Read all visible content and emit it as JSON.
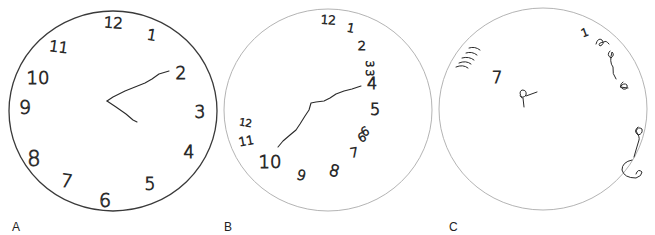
{
  "figure": {
    "panels": [
      {
        "label": "A",
        "label_pos": [
          12,
          221
        ],
        "face": {
          "cx": 113,
          "cy": 111,
          "rx": 104,
          "ry": 100,
          "stroke": "#3a3a3a",
          "width": 1.3
        },
        "numerals": [
          {
            "text": "12",
            "x": 113,
            "y": 28,
            "size": 15,
            "rot": 4
          },
          {
            "text": "1",
            "x": 151,
            "y": 40,
            "size": 15,
            "rot": 10
          },
          {
            "text": "2",
            "x": 181,
            "y": 79,
            "size": 17,
            "rot": 0
          },
          {
            "text": "3",
            "x": 200,
            "y": 118,
            "size": 17,
            "rot": 0
          },
          {
            "text": "4",
            "x": 189,
            "y": 158,
            "size": 17,
            "rot": 0
          },
          {
            "text": "5",
            "x": 150,
            "y": 190,
            "size": 17,
            "rot": 0
          },
          {
            "text": "6",
            "x": 105,
            "y": 207,
            "size": 19,
            "rot": 0
          },
          {
            "text": "7",
            "x": 66,
            "y": 187,
            "size": 18,
            "rot": 8
          },
          {
            "text": "8",
            "x": 34,
            "y": 166,
            "size": 21,
            "rot": 0
          },
          {
            "text": "9",
            "x": 25,
            "y": 114,
            "size": 19,
            "rot": 0
          },
          {
            "text": "10",
            "x": 38,
            "y": 84,
            "size": 18,
            "rot": 0
          },
          {
            "text": "11",
            "x": 58,
            "y": 52,
            "size": 15,
            "rot": 8
          }
        ],
        "hands": [
          "M107,101 L113,97 L125,91 L135,87 L145,83 L152,79 L159,74 L169,71",
          "M107,101 L116,107 L126,114 L133,120 L137,122"
        ]
      },
      {
        "label": "B",
        "label_pos": [
          224,
          221
        ],
        "face": {
          "cx": 328,
          "cy": 110,
          "rx": 104,
          "ry": 101,
          "stroke": "#b4b4b4",
          "width": 1
        },
        "numerals": [
          {
            "text": "12",
            "x": 328,
            "y": 24,
            "size": 12,
            "rot": 4
          },
          {
            "text": "1",
            "x": 350,
            "y": 32,
            "size": 12,
            "rot": 12
          },
          {
            "text": "2",
            "x": 362,
            "y": 50,
            "size": 13,
            "rot": 0
          },
          {
            "text": "3",
            "x": 366,
            "y": 64,
            "size": 11,
            "rot": 90
          },
          {
            "text": "3",
            "x": 366,
            "y": 73,
            "size": 11,
            "rot": 90
          },
          {
            "text": "4",
            "x": 372,
            "y": 89,
            "size": 16,
            "rot": 0
          },
          {
            "text": "5",
            "x": 375,
            "y": 115,
            "size": 16,
            "rot": 0
          },
          {
            "text": "6",
            "x": 367,
            "y": 135,
            "size": 12,
            "rot": -30
          },
          {
            "text": "6",
            "x": 364,
            "y": 141,
            "size": 12,
            "rot": -30
          },
          {
            "text": "7",
            "x": 355,
            "y": 157,
            "size": 13,
            "rot": -10
          },
          {
            "text": "8",
            "x": 333,
            "y": 176,
            "size": 16,
            "rot": 15
          },
          {
            "text": "9",
            "x": 300,
            "y": 180,
            "size": 14,
            "rot": 15
          },
          {
            "text": "10",
            "x": 270,
            "y": 168,
            "size": 18,
            "rot": 0
          },
          {
            "text": "11",
            "x": 247,
            "y": 145,
            "size": 12,
            "rot": -10
          },
          {
            "text": "12",
            "x": 245,
            "y": 126,
            "size": 10,
            "rot": 10
          }
        ],
        "hands": [
          "M278,147 L283,141 L290,135 L296,130 L300,124 L305,116 L309,110 L311,103 L316,102 L324,101 L330,98 L336,94 L344,91 L352,89 L361,86"
        ]
      },
      {
        "label": "C",
        "label_pos": [
          449,
          221
        ],
        "face": {
          "cx": 543,
          "cy": 109,
          "rx": 104,
          "ry": 101,
          "stroke": "#b4b4b4",
          "width": 1
        },
        "numerals": [
          {
            "text": "1",
            "x": 586,
            "y": 36,
            "size": 11,
            "rot": -20
          },
          {
            "text": "7",
            "x": 497,
            "y": 83,
            "size": 16,
            "rot": 0
          }
        ],
        "scribbles": [
          "M456,67 Q463,64 468,68",
          "M459,63 Q466,60 471,64",
          "M462,58 Q469,56 474,60",
          "M466,53 Q472,51 477,55",
          "M469,48 Q475,46 480,50",
          "M596,44 Q598,37 602,40 Q605,44 600,46 Q597,43 604,42 Q606,40 609,44",
          "M610,51 Q606,55 611,58 Q615,55 612,52 Q609,62 613,67 Q612,74 616,79",
          "M623,82 Q618,86 623,89 Q628,90 627,85 Q624,82 620,87 L628,88",
          "M638,127 Q633,131 638,135 Q643,134 642,129 Q638,126 636,131 Q640,137 639,140 L636,150 L634,157",
          "M632,160 Q622,162 622,170 Q624,178 636,178 Q642,176 642,172 Q638,168 636,174",
          "M522,98 Q518,92 522,90 Q527,90 526,95 Q523,99 520,96 M523,98 L524,107 M526,96 L537,92"
        ]
      }
    ]
  }
}
